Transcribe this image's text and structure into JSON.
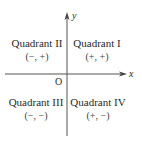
{
  "axes": {
    "x_label": "x",
    "y_label": "y",
    "origin_label": "O"
  },
  "quadrants": [
    {
      "name": "Quadrant I",
      "signs": "(+, +)"
    },
    {
      "name": "Quadrant II",
      "signs": "(−, +)"
    },
    {
      "name": "Quadrant III",
      "signs": "(−, −)"
    },
    {
      "name": "Quadrant IV",
      "signs": "(+, −)"
    }
  ],
  "colors": {
    "axis": "#555555",
    "text": "#2a2a2a"
  }
}
